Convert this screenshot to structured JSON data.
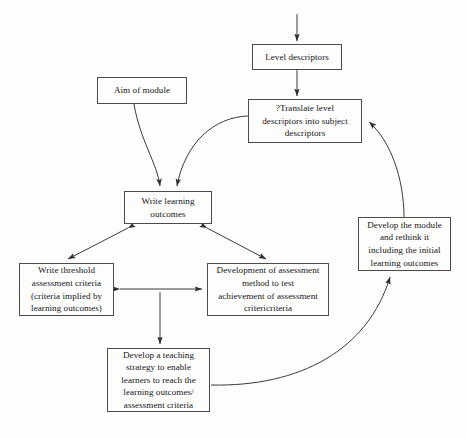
{
  "diagram": {
    "background_color": "#fdfdfb",
    "line_color": "#3a3a3a",
    "box_border_color": "#4b4b4b",
    "text_color": "#15161a",
    "nodes": [
      {
        "id": "level-descriptors",
        "label": "Level descriptors",
        "x": 252,
        "y": 44,
        "w": 90,
        "h": 26
      },
      {
        "id": "aim-of-module",
        "label": "Aim of module",
        "x": 97,
        "y": 77,
        "w": 90,
        "h": 27
      },
      {
        "id": "translate-level-descriptors",
        "label": "?Translate level\ndescriptors into subject\ndescriptors",
        "x": 248,
        "y": 99,
        "w": 114,
        "h": 44
      },
      {
        "id": "write-learning-outcomes",
        "label": "Write learning\noutcomes",
        "x": 124,
        "y": 191,
        "w": 88,
        "h": 33
      },
      {
        "id": "develop-the-module",
        "label": "Develop the module\nand rethink it\nincluding the initial\nlearning outcomes",
        "x": 358,
        "y": 217,
        "w": 93,
        "h": 54
      },
      {
        "id": "write-threshold-criteria",
        "label": "Write threshold\nassessment criteria\n(criteria implied by\nlearning outcomes)",
        "x": 19,
        "y": 263,
        "w": 95,
        "h": 53
      },
      {
        "id": "development-of-assessment",
        "label": "Development of assessment\nmethod to test\nachievement of assessment\ncritericriteria",
        "x": 207,
        "y": 263,
        "w": 122,
        "h": 53
      },
      {
        "id": "develop-teaching-strategy",
        "label": "Develop a teaching\nstrategy to enable\nlearners to reach the\nlearning outcomes/\nassessment criteria",
        "x": 107,
        "y": 348,
        "w": 103,
        "h": 64
      }
    ],
    "edges": [
      {
        "id": "entry-to-level-descriptors",
        "from": "top-of-diagram",
        "to": "level-descriptors",
        "style": "straight",
        "arrows": "end"
      },
      {
        "id": "level-descriptors-to-translate",
        "from": "level-descriptors",
        "to": "translate-level-descriptors",
        "style": "straight",
        "arrows": "end"
      },
      {
        "id": "aim-to-write-outcomes",
        "from": "aim-of-module",
        "to": "write-learning-outcomes",
        "style": "curved",
        "arrows": "end"
      },
      {
        "id": "translate-to-write-outcomes",
        "from": "translate-level-descriptors",
        "to": "write-learning-outcomes",
        "style": "curved",
        "arrows": "end"
      },
      {
        "id": "develop-module-to-translate",
        "from": "develop-the-module",
        "to": "translate-level-descriptors",
        "style": "curved",
        "arrows": "end"
      },
      {
        "id": "write-outcomes-to-threshold",
        "from": "write-learning-outcomes",
        "to": "write-threshold-criteria",
        "style": "straight",
        "arrows": "both"
      },
      {
        "id": "write-outcomes-to-assessment",
        "from": "write-learning-outcomes",
        "to": "development-of-assessment",
        "style": "straight",
        "arrows": "both"
      },
      {
        "id": "threshold-to-assessment",
        "from": "write-threshold-criteria",
        "to": "development-of-assessment",
        "style": "straight",
        "arrows": "both"
      },
      {
        "id": "to-teaching-strategy",
        "from": "threshold-to-assessment",
        "to": "develop-teaching-strategy",
        "style": "straight",
        "arrows": "end"
      },
      {
        "id": "teaching-strategy-to-develop-module",
        "from": "develop-teaching-strategy",
        "to": "develop-the-module",
        "style": "curved",
        "arrows": "end"
      }
    ]
  }
}
